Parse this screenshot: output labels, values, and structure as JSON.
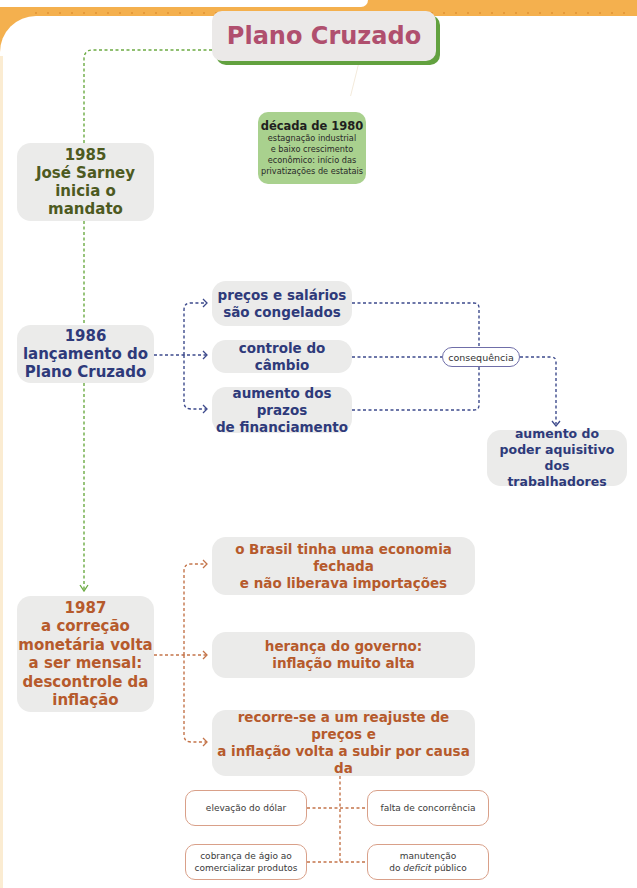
{
  "title": "Plano Cruzado",
  "colors": {
    "accent_band": "#f4b04e",
    "title_text": "#b04f6e",
    "title_shadow": "#62a13f",
    "green_text": "#4d5a1f",
    "blue_text": "#2e3a7a",
    "orange_text": "#b65a2c",
    "box_fill": "#ebebea",
    "note_fill": "#a9d18e",
    "green_connector": "#6cab43",
    "blue_connector": "#3d4a8c",
    "orange_connector": "#c4744a"
  },
  "note": {
    "title": "década de 1980",
    "text": "estagnação industrial\ne baixo crescimento\neconômico: início das\nprivatizações de estatais"
  },
  "timeline": [
    {
      "year": "1985",
      "text": "1985\nJosé Sarney\ninicia o mandato"
    },
    {
      "year": "1986",
      "text": "1986\nlançamento do\nPlano Cruzado"
    },
    {
      "year": "1987",
      "text": "1987\na correção\nmonetária volta\na ser mensal:\ndescontrole da\ninflação"
    }
  ],
  "plano_1986": {
    "measures": [
      "preços e salários\nsão congelados",
      "controle do câmbio",
      "aumento dos prazos\nde financiamento"
    ],
    "connector_label": "consequência",
    "result": "aumento do\npoder aquisitivo dos\ntrabalhadores"
  },
  "crise_1987": {
    "causes": [
      "o Brasil tinha uma economia fechada\ne não liberava importações",
      "herança do governo:\ninflação muito alta",
      "recorre-se a um reajuste de preços e\na inflação volta a subir por causa da"
    ],
    "factors": [
      "elevação do dólar",
      "falta de concorrência",
      "cobrança de ágio ao\ncomercializar produtos",
      {
        "prefix": "manutenção\ndo ",
        "italic": "deficit",
        "suffix": " público"
      }
    ],
    "factor_4_line1": "manutenção",
    "factor_4_line2_prefix": "do ",
    "factor_4_line2_italic": "deficit",
    "factor_4_line2_suffix": " público"
  }
}
